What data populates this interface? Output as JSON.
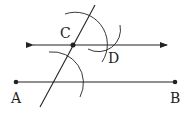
{
  "diagram": {
    "colors": {
      "stroke": "#222222",
      "background": "#ffffff"
    },
    "points": {
      "A": {
        "label": "A",
        "x": 16,
        "y": 82
      },
      "B": {
        "label": "B",
        "x": 175,
        "y": 82
      },
      "C": {
        "label": "C",
        "x": 73,
        "y": 45
      },
      "D": {
        "label": "D",
        "x": 106,
        "y": 45
      }
    },
    "segments": [
      {
        "name": "segment-ab",
        "from": "A",
        "to": "B"
      }
    ],
    "lines": [
      {
        "name": "parallel-line-cd",
        "through": [
          "C",
          "D"
        ],
        "arrows": "both"
      },
      {
        "name": "transversal-line",
        "through": [
          "C"
        ],
        "arrows": "none"
      }
    ],
    "arcs": [
      {
        "name": "arc-lower",
        "center": "transversal ∩ AB"
      },
      {
        "name": "arc-upper",
        "center": "C"
      },
      {
        "name": "arc-small-d",
        "center": "near C"
      }
    ]
  }
}
